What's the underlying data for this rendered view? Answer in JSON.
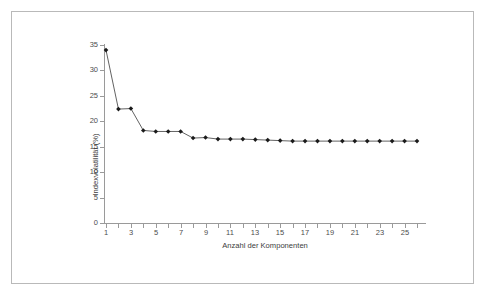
{
  "figure": {
    "background_color": "#ffffff",
    "frame_color": "#b9b9b9",
    "axis_color": "#9a9a9a",
    "series_color": "#3a3a3a",
    "marker_color": "#1a1a1a"
  },
  "chart_data": {
    "type": "line",
    "title": "",
    "xlabel": "Anzahl der Komponenten",
    "ylabel": "Indexvolatilität (%)",
    "xlim": [
      1,
      26
    ],
    "ylim": [
      0,
      35
    ],
    "ytick_step": 5,
    "xtick_step": 2,
    "grid": false,
    "legend": "none",
    "marker": "diamond",
    "x": [
      1,
      2,
      3,
      4,
      5,
      6,
      7,
      8,
      9,
      10,
      11,
      12,
      13,
      14,
      15,
      16,
      17,
      18,
      19,
      20,
      21,
      22,
      23,
      24,
      25,
      26
    ],
    "y": [
      34.0,
      22.4,
      22.5,
      18.2,
      18.0,
      18.0,
      18.0,
      16.7,
      16.8,
      16.5,
      16.5,
      16.5,
      16.4,
      16.3,
      16.2,
      16.1,
      16.1,
      16.1,
      16.1,
      16.1,
      16.1,
      16.1,
      16.1,
      16.1,
      16.1,
      16.1
    ],
    "ytick_labels": [
      "0",
      "5",
      "10",
      "15",
      "20",
      "25",
      "30",
      "35"
    ],
    "ytick_values": [
      0,
      5,
      10,
      15,
      20,
      25,
      30,
      35
    ],
    "xtick_labels": [
      "1",
      "3",
      "5",
      "7",
      "9",
      "11",
      "13",
      "15",
      "17",
      "19",
      "21",
      "23",
      "25"
    ],
    "xtick_values": [
      1,
      3,
      5,
      7,
      9,
      11,
      13,
      15,
      17,
      19,
      21,
      23,
      25
    ],
    "series": [
      {
        "name": "Indexvolatilität",
        "values": [
          34.0,
          22.4,
          22.5,
          18.2,
          18.0,
          18.0,
          18.0,
          16.7,
          16.8,
          16.5,
          16.5,
          16.5,
          16.4,
          16.3,
          16.2,
          16.1,
          16.1,
          16.1,
          16.1,
          16.1,
          16.1,
          16.1,
          16.1,
          16.1,
          16.1,
          16.1
        ]
      }
    ]
  }
}
